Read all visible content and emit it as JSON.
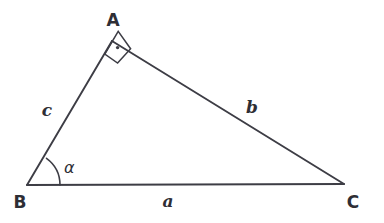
{
  "diagram": {
    "kind": "right-triangle-geometry-figure",
    "background_color": "#ffffff",
    "stroke_color": "#3d3d45",
    "text_color": "#2e2e35",
    "vertices": [
      {
        "id": "A",
        "label": "A",
        "x": 112,
        "y": 41,
        "label_x": 113,
        "label_y": 26
      },
      {
        "id": "B",
        "label": "B",
        "x": 27,
        "y": 185,
        "label_x": 20,
        "label_y": 208
      },
      {
        "id": "C",
        "label": "C",
        "x": 344,
        "y": 184,
        "label_x": 353,
        "label_y": 208
      }
    ],
    "sides": [
      {
        "id": "a",
        "label": "a",
        "from": "B",
        "to": "C",
        "label_x": 168,
        "label_y": 207
      },
      {
        "id": "b",
        "label": "b",
        "from": "A",
        "to": "C",
        "label_x": 252,
        "label_y": 113
      },
      {
        "id": "c",
        "label": "c",
        "from": "B",
        "to": "A",
        "label_x": 47,
        "label_y": 116
      }
    ],
    "angles": [
      {
        "id": "alpha",
        "label": "α",
        "at_vertex": "B",
        "label_x": 64,
        "label_y": 173,
        "marker": "arc",
        "arc_radius": 33
      },
      {
        "id": "right-angle",
        "label": "",
        "at_vertex": "A",
        "marker": "right-angle-square-with-dot",
        "marker_size": 17
      }
    ],
    "paths": {
      "triangle": "M 27 185 L 112 41 L 344 184 Z",
      "right_angle_square": "M 104.5 54.5 L 118.4 31.2 L 131.0 49.1 L 117.1 63.2 Z",
      "angle_arc": "M 60 185 A 33 33 0 0 0 46.6 158.4"
    },
    "right_angle_dot": {
      "x": 117.5,
      "y": 47.5,
      "r": 1.6
    }
  }
}
